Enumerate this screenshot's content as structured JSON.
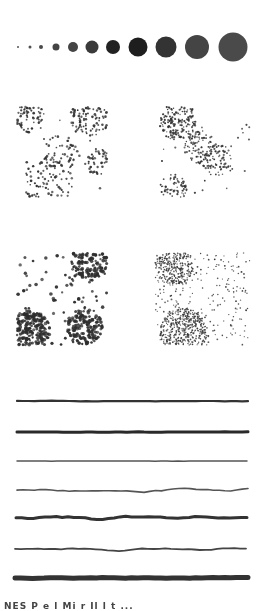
{
  "figure": {
    "background": "#ffffff",
    "ink": "#2a2a2a",
    "size_scale": {
      "center_y": 47,
      "circles": [
        {
          "cx": 18,
          "d": 2,
          "color": "#555555"
        },
        {
          "cx": 30,
          "d": 3,
          "color": "#505050"
        },
        {
          "cx": 41,
          "d": 4,
          "color": "#4a4a4a"
        },
        {
          "cx": 56,
          "d": 7,
          "color": "#444444"
        },
        {
          "cx": 73,
          "d": 10,
          "color": "#444444"
        },
        {
          "cx": 92,
          "d": 13,
          "color": "#3a3a3a"
        },
        {
          "cx": 113,
          "d": 14,
          "color": "#222222"
        },
        {
          "cx": 138,
          "d": 19,
          "color": "#1e1e1e"
        },
        {
          "cx": 166,
          "d": 21,
          "color": "#333333"
        },
        {
          "cx": 197,
          "d": 24,
          "color": "#444444"
        },
        {
          "cx": 233,
          "d": 29,
          "color": "#4a4a4a"
        }
      ]
    },
    "dot_fields": [
      {
        "name": "field-top-left",
        "x": 17,
        "y": 107,
        "w": 90,
        "h": 90,
        "count": 330,
        "dot": 2.2,
        "seed": 11,
        "color": "#333333",
        "clusters": [
          {
            "x": 0.12,
            "y": 0.1,
            "r": 0.18,
            "w": 3
          },
          {
            "x": 0.8,
            "y": 0.12,
            "r": 0.22,
            "w": 3
          },
          {
            "x": 0.35,
            "y": 0.85,
            "r": 0.28,
            "w": 4
          },
          {
            "x": 0.5,
            "y": 0.5,
            "r": 0.2,
            "w": 1.5
          },
          {
            "x": 0.9,
            "y": 0.6,
            "r": 0.15,
            "w": 1.5
          }
        ]
      },
      {
        "name": "field-top-right",
        "x": 160,
        "y": 107,
        "w": 90,
        "h": 90,
        "count": 420,
        "dot": 1.9,
        "seed": 29,
        "color": "#333333",
        "clusters": [
          {
            "x": 0.2,
            "y": 0.15,
            "r": 0.22,
            "w": 5
          },
          {
            "x": 0.45,
            "y": 0.45,
            "r": 0.18,
            "w": 2.5
          },
          {
            "x": 0.65,
            "y": 0.6,
            "r": 0.18,
            "w": 2
          },
          {
            "x": 0.15,
            "y": 0.9,
            "r": 0.15,
            "w": 1.5
          }
        ]
      },
      {
        "name": "field-bottom-left",
        "x": 17,
        "y": 253,
        "w": 90,
        "h": 92,
        "count": 520,
        "dot": 3.0,
        "seed": 47,
        "color": "#2e2e2e",
        "clusters": [
          {
            "x": 0.15,
            "y": 0.85,
            "r": 0.22,
            "w": 2.5
          },
          {
            "x": 0.8,
            "y": 0.1,
            "r": 0.2,
            "w": 1.5
          },
          {
            "x": 0.75,
            "y": 0.8,
            "r": 0.2,
            "w": 1.5
          }
        ]
      },
      {
        "name": "field-bottom-right",
        "x": 155,
        "y": 253,
        "w": 95,
        "h": 92,
        "count": 900,
        "dot": 1.5,
        "seed": 83,
        "color": "#3a3a3a",
        "clusters": [
          {
            "x": 0.3,
            "y": 0.85,
            "r": 0.25,
            "w": 1.5
          },
          {
            "x": 0.2,
            "y": 0.15,
            "r": 0.2,
            "w": 1.2
          }
        ]
      }
    ],
    "lines": [
      {
        "name": "line-1-straight-medium",
        "y": 401,
        "x1": 17,
        "x2": 248,
        "width": 2.2,
        "amp": 0.5,
        "color": "#333333",
        "seed": 3
      },
      {
        "name": "line-2-straight-thick",
        "y": 432,
        "x1": 17,
        "x2": 248,
        "width": 3.0,
        "amp": 0.6,
        "color": "#2a2a2a",
        "seed": 5
      },
      {
        "name": "line-3-straight-thin",
        "y": 461,
        "x1": 17,
        "x2": 247,
        "width": 1.5,
        "amp": 0.4,
        "color": "#555555",
        "seed": 7
      },
      {
        "name": "line-4-wavy-thin",
        "y": 490,
        "x1": 17,
        "x2": 248,
        "width": 1.6,
        "amp": 1.8,
        "color": "#555555",
        "seed": 9
      },
      {
        "name": "line-5-wavy-thick",
        "y": 518,
        "x1": 16,
        "x2": 247,
        "width": 3.0,
        "amp": 2.2,
        "color": "#333333",
        "seed": 13
      },
      {
        "name": "line-6-curved-thin",
        "y": 549,
        "x1": 15,
        "x2": 246,
        "width": 1.8,
        "amp": 1.5,
        "color": "#444444",
        "seed": 17
      },
      {
        "name": "line-7-rough-thick",
        "y": 578,
        "x1": 15,
        "x2": 248,
        "width": 5.0,
        "amp": 1.0,
        "color": "#333333",
        "seed": 19
      }
    ],
    "caption": "NES  P e l  Mi   r   Il  l   t   ..."
  }
}
